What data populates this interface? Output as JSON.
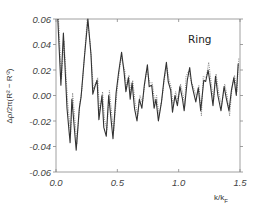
{
  "chart_data": {
    "type": "line",
    "title": "",
    "annotation": "Ring",
    "xlabel": "k/k_F",
    "xlabel_main": "k/k",
    "xlabel_sub": "F",
    "ylabel": "Δρ/2π(R² − R'²)",
    "xlim": [
      0.0,
      1.5
    ],
    "ylim": [
      -0.06,
      0.06
    ],
    "xticks": [
      0.0,
      0.5,
      1.0,
      1.5
    ],
    "xtick_labels": [
      "0.0",
      "0.5",
      "1.0",
      "1.5"
    ],
    "yticks": [
      -0.06,
      -0.04,
      -0.02,
      0.0,
      0.02,
      0.04,
      0.06
    ],
    "ytick_labels": [
      "-0.06",
      "-0.04",
      "-0.02",
      "0.00",
      "0.02",
      "0.04",
      "0.06"
    ],
    "grid": false,
    "legend": null,
    "series": [
      {
        "name": "solid",
        "style": "solid",
        "color": "#333333",
        "points": [
          [
            0.015,
            0.06
          ],
          [
            0.04,
            0.008
          ],
          [
            0.06,
            0.049
          ],
          [
            0.09,
            -0.01
          ],
          [
            0.115,
            -0.037
          ],
          [
            0.13,
            -0.003
          ],
          [
            0.165,
            -0.043
          ],
          [
            0.19,
            -0.01
          ],
          [
            0.205,
            -0.001
          ],
          [
            0.23,
            0.028
          ],
          [
            0.26,
            0.06
          ],
          [
            0.285,
            0.032
          ],
          [
            0.3,
            0.001
          ],
          [
            0.32,
            0.008
          ],
          [
            0.335,
            0.012
          ],
          [
            0.35,
            -0.019
          ],
          [
            0.375,
            0.0
          ],
          [
            0.39,
            -0.025
          ],
          [
            0.41,
            -0.032
          ],
          [
            0.43,
            0.0
          ],
          [
            0.45,
            -0.02
          ],
          [
            0.465,
            -0.034
          ],
          [
            0.49,
            0.002
          ],
          [
            0.51,
            0.018
          ],
          [
            0.535,
            0.034
          ],
          [
            0.555,
            0.018
          ],
          [
            0.57,
            0.003
          ],
          [
            0.59,
            0.014
          ],
          [
            0.605,
            -0.003
          ],
          [
            0.62,
            0.01
          ],
          [
            0.64,
            -0.01
          ],
          [
            0.66,
            -0.02
          ],
          [
            0.68,
            -0.003
          ],
          [
            0.7,
            -0.01
          ],
          [
            0.72,
            0.008
          ],
          [
            0.745,
            0.024
          ],
          [
            0.76,
            0.007
          ],
          [
            0.78,
            0.008
          ],
          [
            0.8,
            -0.01
          ],
          [
            0.815,
            -0.003
          ],
          [
            0.835,
            -0.02
          ],
          [
            0.86,
            -0.005
          ],
          [
            0.88,
            0.012
          ],
          [
            0.9,
            0.026
          ],
          [
            0.915,
            0.011
          ],
          [
            0.935,
            0.004
          ],
          [
            0.95,
            -0.013
          ],
          [
            0.97,
            0.0
          ],
          [
            0.99,
            -0.008
          ],
          [
            1.01,
            0.007
          ],
          [
            1.03,
            -0.002
          ],
          [
            1.045,
            -0.012
          ],
          [
            1.07,
            0.012
          ],
          [
            1.09,
            0.022
          ],
          [
            1.105,
            0.01
          ],
          [
            1.12,
            0.003
          ],
          [
            1.14,
            -0.005
          ],
          [
            1.16,
            0.006
          ],
          [
            1.18,
            -0.012
          ],
          [
            1.205,
            0.012
          ],
          [
            1.22,
            0.011
          ],
          [
            1.24,
            0.02
          ],
          [
            1.26,
            0.007
          ],
          [
            1.28,
            -0.008
          ],
          [
            1.3,
            0.015
          ],
          [
            1.32,
            0.0
          ],
          [
            1.345,
            -0.012
          ],
          [
            1.37,
            0.007
          ],
          [
            1.39,
            -0.003
          ],
          [
            1.41,
            -0.012
          ],
          [
            1.43,
            0.004
          ],
          [
            1.45,
            0.014
          ],
          [
            1.47,
            0.0
          ],
          [
            1.485,
            0.025
          ]
        ]
      },
      {
        "name": "dotted",
        "style": "dotted",
        "color": "#777777",
        "points": [
          [
            0.02,
            0.06
          ],
          [
            0.045,
            0.013
          ],
          [
            0.065,
            0.043
          ],
          [
            0.095,
            -0.006
          ],
          [
            0.12,
            -0.03
          ],
          [
            0.135,
            0.002
          ],
          [
            0.17,
            -0.038
          ],
          [
            0.195,
            -0.006
          ],
          [
            0.21,
            0.004
          ],
          [
            0.235,
            0.035
          ],
          [
            0.255,
            0.06
          ],
          [
            0.28,
            0.04
          ],
          [
            0.305,
            0.005
          ],
          [
            0.325,
            0.01
          ],
          [
            0.34,
            0.014
          ],
          [
            0.355,
            -0.013
          ],
          [
            0.38,
            0.003
          ],
          [
            0.395,
            -0.019
          ],
          [
            0.415,
            -0.027
          ],
          [
            0.435,
            0.004
          ],
          [
            0.455,
            -0.015
          ],
          [
            0.47,
            -0.028
          ],
          [
            0.5,
            0.006
          ],
          [
            0.52,
            0.022
          ],
          [
            0.53,
            0.03
          ],
          [
            0.56,
            0.02
          ],
          [
            0.575,
            0.006
          ],
          [
            0.595,
            0.016
          ],
          [
            0.61,
            0.001
          ],
          [
            0.625,
            0.012
          ],
          [
            0.645,
            -0.005
          ],
          [
            0.665,
            -0.016
          ],
          [
            0.685,
            0.0
          ],
          [
            0.705,
            -0.006
          ],
          [
            0.725,
            0.01
          ],
          [
            0.74,
            0.02
          ],
          [
            0.765,
            0.01
          ],
          [
            0.785,
            0.01
          ],
          [
            0.805,
            -0.006
          ],
          [
            0.82,
            0.0
          ],
          [
            0.84,
            -0.016
          ],
          [
            0.865,
            -0.002
          ],
          [
            0.885,
            0.014
          ],
          [
            0.905,
            0.022
          ],
          [
            0.92,
            0.013
          ],
          [
            0.94,
            0.006
          ],
          [
            0.955,
            -0.009
          ],
          [
            0.975,
            0.003
          ],
          [
            0.995,
            -0.004
          ],
          [
            1.015,
            0.009
          ],
          [
            1.035,
            0.001
          ],
          [
            1.05,
            -0.008
          ],
          [
            1.06,
            0.015
          ],
          [
            1.08,
            0.019
          ],
          [
            1.1,
            0.012
          ],
          [
            1.125,
            0.005
          ],
          [
            1.145,
            -0.001
          ],
          [
            1.165,
            0.008
          ],
          [
            1.185,
            -0.016
          ],
          [
            1.2,
            0.015
          ],
          [
            1.225,
            0.014
          ],
          [
            1.245,
            0.026
          ],
          [
            1.265,
            0.01
          ],
          [
            1.285,
            -0.004
          ],
          [
            1.305,
            0.017
          ],
          [
            1.325,
            0.003
          ],
          [
            1.35,
            -0.008
          ],
          [
            1.375,
            0.009
          ],
          [
            1.395,
            0.0
          ],
          [
            1.415,
            -0.016
          ],
          [
            1.435,
            0.006
          ],
          [
            1.455,
            0.016
          ],
          [
            1.475,
            0.003
          ],
          [
            1.49,
            0.029
          ]
        ]
      }
    ]
  }
}
